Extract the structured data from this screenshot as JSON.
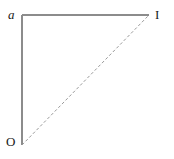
{
  "figure": {
    "type": "geometric-diagram",
    "background_color": "#ffffff",
    "line_color": "#8c8c8c",
    "label_color": "#1a1a1a",
    "labels": {
      "top_left": "a",
      "top_right": "I",
      "bottom_left": "O"
    },
    "vertices": {
      "O": {
        "x": 22,
        "y": 145
      },
      "a": {
        "x": 22,
        "y": 15
      },
      "I": {
        "x": 149,
        "y": 15
      }
    },
    "edges": [
      {
        "name": "vertical-leg",
        "from": "O",
        "to": "a",
        "style": "solid"
      },
      {
        "name": "horizontal-leg",
        "from": "a",
        "to": "I",
        "style": "solid"
      },
      {
        "name": "hypotenuse",
        "from": "O",
        "to": "I",
        "style": "dashed"
      }
    ]
  }
}
